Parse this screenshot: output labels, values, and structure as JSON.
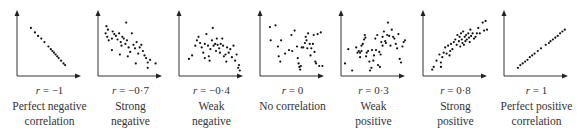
{
  "chart_data": {
    "type": "scatter",
    "title": "",
    "grid": false,
    "panels": [
      {
        "r_label": "r = −1",
        "r_value": -1,
        "desc": [
          "Perfect negative",
          "correlation"
        ],
        "points": [
          [
            15,
            18
          ],
          [
            20,
            23
          ],
          [
            24,
            27
          ],
          [
            28,
            30
          ],
          [
            32,
            34
          ],
          [
            37,
            39
          ],
          [
            40,
            42
          ],
          [
            42,
            44
          ],
          [
            44,
            46
          ],
          [
            46,
            48
          ],
          [
            48,
            50
          ],
          [
            50,
            52
          ],
          [
            53,
            55
          ],
          [
            56,
            58
          ],
          [
            58,
            60
          ]
        ]
      },
      {
        "r_label": "r = −0.7",
        "r_value": -0.7,
        "desc": [
          "Strong",
          "negative"
        ],
        "points": [
          [
            8,
            16
          ],
          [
            10,
            20
          ],
          [
            7,
            24
          ],
          [
            9,
            28
          ],
          [
            11,
            32
          ],
          [
            16,
            22
          ],
          [
            18,
            25
          ],
          [
            15,
            30
          ],
          [
            20,
            27
          ],
          [
            22,
            31
          ],
          [
            24,
            24
          ],
          [
            26,
            34
          ],
          [
            28,
            28
          ],
          [
            30,
            30
          ],
          [
            27,
            38
          ],
          [
            32,
            36
          ],
          [
            34,
            32
          ],
          [
            36,
            40
          ],
          [
            38,
            45
          ],
          [
            40,
            24
          ],
          [
            33,
            12
          ],
          [
            42,
            37
          ],
          [
            44,
            41
          ],
          [
            46,
            34
          ],
          [
            48,
            47
          ],
          [
            50,
            40
          ],
          [
            52,
            37
          ],
          [
            54,
            44
          ],
          [
            56,
            49
          ],
          [
            58,
            52
          ],
          [
            60,
            57
          ],
          [
            63,
            54
          ],
          [
            45,
            58
          ],
          [
            15,
            43
          ],
          [
            25,
            48
          ],
          [
            35,
            50
          ],
          [
            60,
            63
          ],
          [
            70,
            58
          ]
        ]
      },
      {
        "r_label": "r = −0.4",
        "r_value": -0.4,
        "desc": [
          "Weak",
          "negative"
        ],
        "points": [
          [
            10,
            53
          ],
          [
            14,
            49
          ],
          [
            18,
            38
          ],
          [
            20,
            32
          ],
          [
            22,
            28
          ],
          [
            24,
            35
          ],
          [
            26,
            40
          ],
          [
            28,
            46
          ],
          [
            30,
            36
          ],
          [
            32,
            25
          ],
          [
            34,
            38
          ],
          [
            35,
            50
          ],
          [
            37,
            42
          ],
          [
            39,
            32
          ],
          [
            40,
            18
          ],
          [
            41,
            38
          ],
          [
            43,
            36
          ],
          [
            44,
            44
          ],
          [
            45,
            30
          ],
          [
            46,
            37
          ],
          [
            48,
            41
          ],
          [
            49,
            46
          ],
          [
            50,
            36
          ],
          [
            52,
            30
          ],
          [
            53,
            38
          ],
          [
            54,
            50
          ],
          [
            56,
            48
          ],
          [
            57,
            56
          ],
          [
            58,
            40
          ],
          [
            60,
            46
          ],
          [
            62,
            42
          ],
          [
            64,
            51
          ],
          [
            66,
            38
          ],
          [
            68,
            55
          ],
          [
            70,
            48
          ],
          [
            72,
            63
          ],
          [
            73,
            60
          ],
          [
            74,
            66
          ],
          [
            30,
            52
          ],
          [
            36,
            55
          ]
        ]
      },
      {
        "r_label": "r = 0",
        "r_value": 0,
        "desc": [
          "No correlation",
          ""
        ],
        "points": [
          [
            10,
            17
          ],
          [
            17,
            15
          ],
          [
            11,
            32
          ],
          [
            20,
            39
          ],
          [
            24,
            32
          ],
          [
            21,
            50
          ],
          [
            29,
            47
          ],
          [
            23,
            56
          ],
          [
            34,
            43
          ],
          [
            38,
            44
          ],
          [
            37,
            26
          ],
          [
            41,
            21
          ],
          [
            44,
            39
          ],
          [
            45,
            52
          ],
          [
            46,
            58
          ],
          [
            47,
            62
          ],
          [
            48,
            65
          ],
          [
            49,
            61
          ],
          [
            50,
            40
          ],
          [
            52,
            40
          ],
          [
            54,
            35
          ],
          [
            55,
            28
          ],
          [
            56,
            32
          ],
          [
            57,
            41
          ],
          [
            58,
            24
          ],
          [
            60,
            36
          ],
          [
            61,
            49
          ],
          [
            62,
            41
          ],
          [
            64,
            36
          ],
          [
            65,
            26
          ],
          [
            66,
            45
          ],
          [
            67,
            56
          ],
          [
            68,
            58
          ],
          [
            70,
            25
          ],
          [
            72,
            61
          ],
          [
            74,
            23
          ],
          [
            76,
            61
          ]
        ]
      },
      {
        "r_label": "r = 0.3",
        "r_value": 0.3,
        "desc": [
          "Weak",
          "positive"
        ],
        "points": [
          [
            3,
            58
          ],
          [
            8,
            42
          ],
          [
            14,
            66
          ],
          [
            20,
            40
          ],
          [
            22,
            46
          ],
          [
            24,
            44
          ],
          [
            26,
            51
          ],
          [
            26,
            46
          ],
          [
            28,
            38
          ],
          [
            28,
            44
          ],
          [
            30,
            36
          ],
          [
            32,
            31
          ],
          [
            33,
            26
          ],
          [
            34,
            29
          ],
          [
            35,
            50
          ],
          [
            36,
            46
          ],
          [
            38,
            44
          ],
          [
            40,
            56
          ],
          [
            41,
            66
          ],
          [
            43,
            63
          ],
          [
            44,
            43
          ],
          [
            46,
            55
          ],
          [
            47,
            49
          ],
          [
            49,
            30
          ],
          [
            50,
            43
          ],
          [
            52,
            26
          ],
          [
            53,
            60
          ],
          [
            55,
            45
          ],
          [
            56,
            62
          ],
          [
            57,
            48
          ],
          [
            58,
            34
          ],
          [
            60,
            28
          ],
          [
            60,
            38
          ],
          [
            62,
            22
          ],
          [
            64,
            33
          ],
          [
            65,
            35
          ],
          [
            67,
            26
          ],
          [
            68,
            12
          ],
          [
            70,
            27
          ],
          [
            72,
            38
          ],
          [
            74,
            20
          ],
          [
            76,
            28
          ],
          [
            78,
            30
          ],
          [
            80,
            36
          ],
          [
            82,
            41
          ],
          [
            84,
            25
          ],
          [
            86,
            53
          ],
          [
            88,
            57
          ],
          [
            90,
            39
          ],
          [
            92,
            34
          ],
          [
            94,
            32
          ]
        ]
      },
      {
        "r_label": "r = 0.8",
        "r_value": 0.8,
        "desc": [
          "Strong",
          "positive"
        ],
        "points": [
          [
            10,
            65
          ],
          [
            12,
            62
          ],
          [
            16,
            55
          ],
          [
            20,
            48
          ],
          [
            22,
            57
          ],
          [
            24,
            51
          ],
          [
            26,
            46
          ],
          [
            28,
            40
          ],
          [
            30,
            47
          ],
          [
            32,
            38
          ],
          [
            34,
            49
          ],
          [
            35,
            44
          ],
          [
            36,
            36
          ],
          [
            38,
            42
          ],
          [
            40,
            34
          ],
          [
            42,
            31
          ],
          [
            44,
            37
          ],
          [
            45,
            26
          ],
          [
            47,
            33
          ],
          [
            48,
            28
          ],
          [
            49,
            39
          ],
          [
            50,
            24
          ],
          [
            51,
            31
          ],
          [
            52,
            35
          ],
          [
            53,
            22
          ],
          [
            54,
            37
          ],
          [
            55,
            28
          ],
          [
            56,
            33
          ],
          [
            57,
            26
          ],
          [
            58,
            31
          ],
          [
            60,
            24
          ],
          [
            61,
            29
          ],
          [
            62,
            34
          ],
          [
            63,
            20
          ],
          [
            64,
            27
          ],
          [
            66,
            24
          ],
          [
            68,
            30
          ],
          [
            70,
            28
          ],
          [
            72,
            24
          ],
          [
            74,
            18
          ],
          [
            76,
            24
          ],
          [
            80,
            12
          ],
          [
            82,
            21
          ],
          [
            84,
            10
          ],
          [
            86,
            20
          ],
          [
            22,
            62
          ]
        ]
      },
      {
        "r_label": "r = 1",
        "r_value": 1,
        "desc": [
          "Perfect positive",
          "correlation"
        ],
        "points": [
          [
            15,
            63
          ],
          [
            18,
            60
          ],
          [
            21,
            58
          ],
          [
            24,
            56
          ],
          [
            27,
            54
          ],
          [
            30,
            51
          ],
          [
            33,
            49
          ],
          [
            36,
            47
          ],
          [
            40,
            44
          ],
          [
            44,
            41
          ],
          [
            50,
            37
          ],
          [
            54,
            35
          ],
          [
            56,
            33
          ],
          [
            59,
            31
          ],
          [
            62,
            29
          ],
          [
            65,
            27
          ],
          [
            68,
            24
          ],
          [
            71,
            22
          ],
          [
            74,
            20
          ]
        ]
      }
    ],
    "xlabel": "",
    "ylabel": "",
    "legend": "none"
  }
}
